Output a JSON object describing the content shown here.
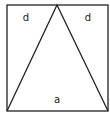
{
  "diagram": {
    "shapes": {
      "square": {
        "x": 7,
        "y": 5,
        "width": 101,
        "height": 106
      },
      "triangle": {
        "apex": [
          57,
          5
        ],
        "base_left": [
          7,
          111
        ],
        "base_right": [
          108,
          111
        ]
      }
    },
    "labels": {
      "left_region": "d",
      "right_region": "d",
      "triangle_region": "a"
    },
    "stroke_color": "#222222",
    "background_color": "#ffffff"
  }
}
